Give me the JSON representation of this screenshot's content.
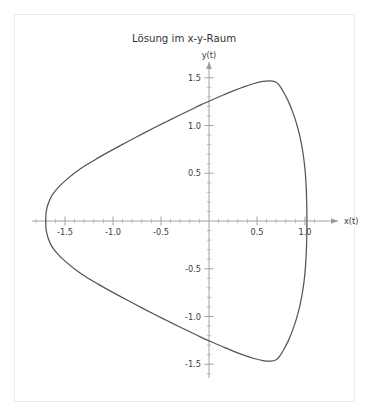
{
  "chart_data": {
    "type": "line",
    "title": "Lösung im x-y-Raum",
    "xlabel": "x(t)",
    "ylabel": "y(t)",
    "xlim": [
      -1.85,
      1.22
    ],
    "ylim": [
      -1.72,
      1.72
    ],
    "grid": false,
    "legend": null,
    "axis_style": "centered-cross",
    "xticks": [
      -1.5,
      -1.0,
      -0.5,
      0.5,
      1.0
    ],
    "xtick_labels": [
      "-1.5",
      "-1.0",
      "-0.5",
      "0.5",
      "1.0"
    ],
    "yticks": [
      -1.5,
      -1.0,
      -0.5,
      0.5,
      1.0,
      1.5
    ],
    "ytick_labels": [
      "-1.5",
      "-1.0",
      "-0.5",
      "0.5",
      "1.0",
      "1.5"
    ],
    "xtick_minor_step": 0.1,
    "ytick_minor_step": 0.1,
    "series": [
      {
        "name": "Trajektorie",
        "color": "#555555",
        "closed": true,
        "x": [
          1.02,
          1.018,
          1.012,
          1.0,
          0.978,
          0.948,
          0.912,
          0.872,
          0.828,
          0.782,
          0.74,
          0.7,
          0.64,
          0.56,
          0.47,
          0.37,
          0.265,
          0.155,
          0.04,
          -0.08,
          -0.2,
          -0.32,
          -0.44,
          -0.56,
          -0.68,
          -0.8,
          -0.92,
          -1.04,
          -1.16,
          -1.28,
          -1.39,
          -1.49,
          -1.57,
          -1.635,
          -1.678,
          -1.698,
          -1.7,
          -1.698,
          -1.678,
          -1.635,
          -1.57,
          -1.49,
          -1.39,
          -1.28,
          -1.16,
          -1.04,
          -0.92,
          -0.8,
          -0.68,
          -0.56,
          -0.44,
          -0.32,
          -0.2,
          -0.08,
          0.04,
          0.155,
          0.265,
          0.37,
          0.47,
          0.56,
          0.64,
          0.7,
          0.74,
          0.782,
          0.828,
          0.872,
          0.912,
          0.948,
          0.978,
          1.0,
          1.012,
          1.018,
          1.02
        ],
        "y": [
          0.0,
          0.18,
          0.36,
          0.54,
          0.72,
          0.88,
          1.02,
          1.14,
          1.25,
          1.34,
          1.41,
          1.452,
          1.468,
          1.462,
          1.44,
          1.408,
          1.368,
          1.322,
          1.272,
          1.218,
          1.16,
          1.102,
          1.042,
          0.982,
          0.92,
          0.856,
          0.792,
          0.726,
          0.658,
          0.586,
          0.51,
          0.428,
          0.352,
          0.268,
          0.172,
          0.08,
          0.0,
          -0.08,
          -0.172,
          -0.268,
          -0.352,
          -0.428,
          -0.51,
          -0.586,
          -0.658,
          -0.726,
          -0.792,
          -0.856,
          -0.92,
          -0.982,
          -1.042,
          -1.102,
          -1.16,
          -1.218,
          -1.272,
          -1.322,
          -1.368,
          -1.408,
          -1.44,
          -1.462,
          -1.468,
          -1.452,
          -1.41,
          -1.34,
          -1.25,
          -1.14,
          -1.02,
          -0.88,
          -0.72,
          -0.54,
          -0.36,
          -0.18,
          0.0
        ]
      }
    ],
    "key_points": {
      "left_vertex": [
        -1.7,
        0.0
      ],
      "top_peak": [
        0.7,
        1.468
      ],
      "bottom_peak": [
        0.7,
        -1.468
      ],
      "right_edge_x": 1.02,
      "y_axis_crossing_upper": 1.272,
      "y_axis_crossing_lower": -1.272
    }
  }
}
